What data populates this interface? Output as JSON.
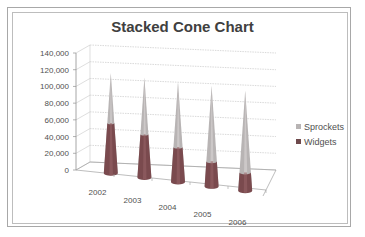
{
  "chart_data": {
    "type": "bar",
    "subtype": "3d-stacked-cone",
    "title": "Stacked Cone Chart",
    "xlabel": "",
    "ylabel": "",
    "categories": [
      "2002",
      "2003",
      "2004",
      "2005",
      "2006"
    ],
    "series": [
      {
        "name": "Widgets",
        "color": "#7a4a4e",
        "values": [
          60000,
          52000,
          42000,
          30000,
          22000
        ]
      },
      {
        "name": "Sprockets",
        "color": "#b8b4b4",
        "values": [
          60000,
          68000,
          78000,
          90000,
          98000
        ]
      }
    ],
    "ylim": [
      0,
      140000
    ],
    "yticks": [
      "0",
      "20,000",
      "40,000",
      "60,000",
      "80,000",
      "100,000",
      "120,000",
      "140,000"
    ],
    "grid": true,
    "legend_position": "right"
  },
  "legend": [
    {
      "label": "Sprockets",
      "color": "#b8b4b4"
    },
    {
      "label": "Widgets",
      "color": "#6e4a4c"
    }
  ]
}
